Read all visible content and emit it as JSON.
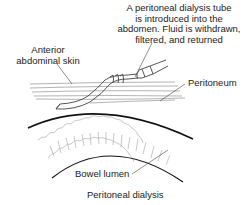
{
  "figure": {
    "caption": "Peritoneal dialysis",
    "labels": {
      "tube_line1": "A peritoneal dialysis tube",
      "tube_line2": "is introduced into the",
      "tube_line3": "abdomen. Fluid is withdrawn,",
      "tube_line4": "filtered, and returned",
      "skin_line1": "Anterior",
      "skin_line2": "abdominal skin",
      "peritoneum": "Peritoneum",
      "bowel": "Bowel lumen"
    },
    "colors": {
      "line": "#222222",
      "light_line": "#9a9a9a",
      "background": "#ffffff"
    }
  }
}
